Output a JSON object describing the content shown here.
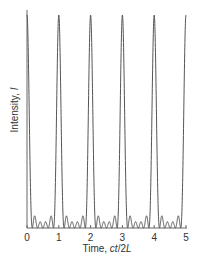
{
  "chart_data": {
    "type": "line",
    "title": "",
    "xlabel": "Time, ct/2L",
    "xlabel_parts": {
      "prefix": "Time, ",
      "italic": "ct",
      "mid": "/2",
      "italic2": "L"
    },
    "ylabel": "Intensity, I",
    "ylabel_parts": {
      "prefix": "Intensity, ",
      "italic": "I"
    },
    "xlim": [
      0,
      5
    ],
    "ylim": [
      0,
      1
    ],
    "x_ticks": [
      "0",
      "1",
      "2",
      "3",
      "4",
      "5"
    ],
    "grid": false,
    "legend": null,
    "peak_positions": [
      0,
      1,
      2,
      3,
      4,
      5
    ],
    "peak_value": 1.0,
    "side_lobe_value": 0.06,
    "side_lobes_per_period": 4,
    "line_color": "#555555"
  }
}
